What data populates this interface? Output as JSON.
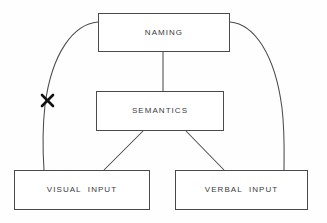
{
  "diagram": {
    "background_color": "#fefefe",
    "stroke_color": "#4a4a4a",
    "text_color": "#3b3b3b",
    "block_mark_color": "#111111",
    "nodes": [
      {
        "id": "naming",
        "label": "NAMING",
        "x": 98,
        "y": 13,
        "width": 132,
        "height": 39
      },
      {
        "id": "semantics",
        "label": "SEMANTICS",
        "x": 96,
        "y": 91,
        "width": 128,
        "height": 40
      },
      {
        "id": "visual_input",
        "label": "VISUAL  INPUT",
        "x": 14,
        "y": 170,
        "width": 136,
        "height": 40
      },
      {
        "id": "verbal_input",
        "label": "VERBAL  INPUT",
        "x": 175,
        "y": 170,
        "width": 133,
        "height": 40
      }
    ],
    "edges": [
      {
        "id": "naming-semantics",
        "from": "naming",
        "to": "semantics",
        "style": "straight-vertical",
        "blocked": false
      },
      {
        "id": "semantics-visual",
        "from": "semantics",
        "to": "visual_input",
        "style": "straight-diagonal",
        "blocked": false
      },
      {
        "id": "semantics-verbal",
        "from": "semantics",
        "to": "verbal_input",
        "style": "straight-diagonal",
        "blocked": false
      },
      {
        "id": "naming-visual",
        "from": "naming",
        "to": "visual_input",
        "style": "curved",
        "blocked": true,
        "block_marker": "x-cross"
      },
      {
        "id": "naming-verbal",
        "from": "naming",
        "to": "verbal_input",
        "style": "curved",
        "blocked": false
      }
    ],
    "markers": [
      {
        "id": "blocked-route-x",
        "type": "x-cross",
        "x": 47,
        "y": 100,
        "size": 9
      }
    ]
  }
}
